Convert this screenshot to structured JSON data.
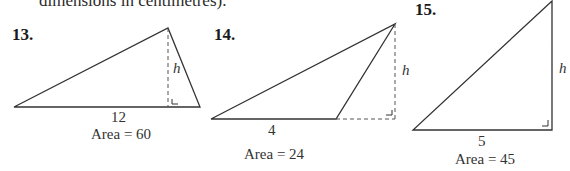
{
  "intro_text": "dimensions in centimetres).",
  "problems": [
    {
      "number": "13.",
      "base_label": "12",
      "height_label": "h",
      "area_label": "Area = 60"
    },
    {
      "number": "14.",
      "base_label": "4",
      "height_label": "h",
      "area_label": "Area = 24"
    },
    {
      "number": "15.",
      "base_label": "5",
      "height_label": "h",
      "area_label": "Area = 45"
    }
  ],
  "colors": {
    "line": "#333333",
    "dashed": "#555555"
  }
}
